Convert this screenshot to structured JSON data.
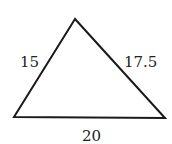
{
  "diagram": {
    "type": "triangle",
    "sides": {
      "left": "15",
      "right": "17.5",
      "bottom": "20"
    },
    "vertices": {
      "top": [
        75,
        19
      ],
      "bottom_left": [
        14,
        117
      ],
      "bottom_right": [
        165,
        118
      ]
    },
    "stroke_color": "#1a1a1a",
    "background": "#ffffff"
  }
}
